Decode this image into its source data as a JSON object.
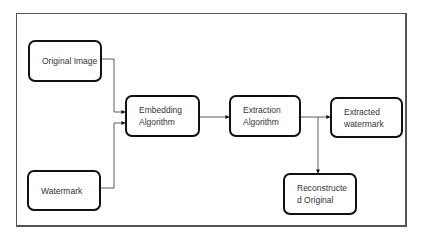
{
  "diagram": {
    "title": "",
    "nodes": [
      {
        "id": "original-image",
        "label": "Original Image"
      },
      {
        "id": "watermark",
        "label": "Watermark"
      },
      {
        "id": "embedding",
        "label": "Embedding\nAlgorithm"
      },
      {
        "id": "extraction",
        "label": "Extraction\nAlgorithm"
      },
      {
        "id": "extracted-watermark",
        "label": "Extracted\nwatermark"
      },
      {
        "id": "reconstructed-original",
        "label": "Reconstructe\nd Original"
      }
    ],
    "edges": [
      {
        "from": "original-image",
        "to": "embedding"
      },
      {
        "from": "watermark",
        "to": "embedding"
      },
      {
        "from": "embedding",
        "to": "extraction"
      },
      {
        "from": "extraction",
        "to": "extracted-watermark"
      },
      {
        "from": "extraction",
        "to": "reconstructed-original"
      }
    ],
    "colors": {
      "stroke": "#111111",
      "text": "#333333",
      "frame": "#555555",
      "background": "#ffffff"
    }
  }
}
